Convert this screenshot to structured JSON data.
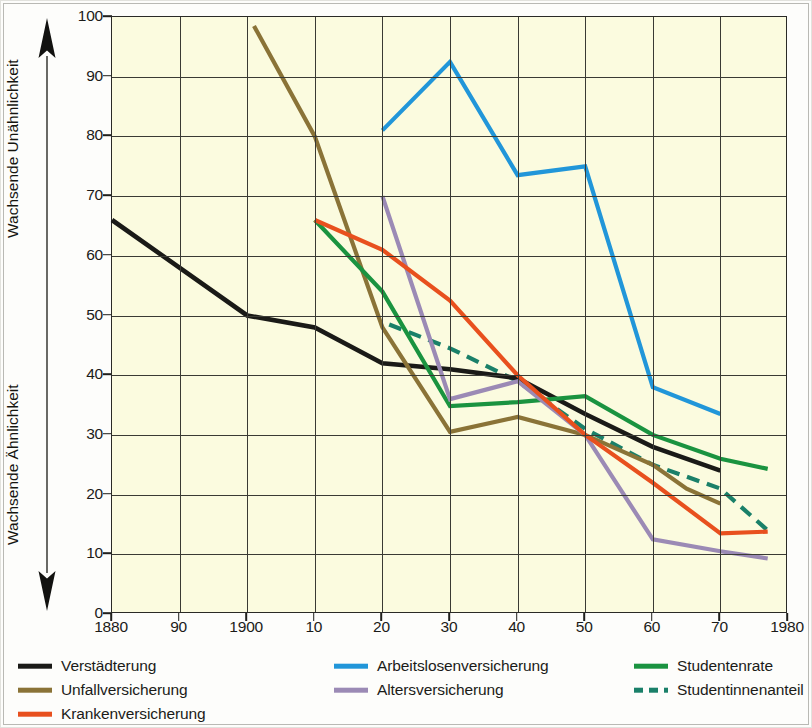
{
  "axes": {
    "y_caption_top": "Wachsende Unähnlichkeit",
    "y_caption_bottom": "Wachsende Ähnlichkeit",
    "y_ticks": [
      "0",
      "10",
      "20",
      "30",
      "40",
      "50",
      "60",
      "70",
      "80",
      "90",
      "100"
    ],
    "x_ticks": [
      "1880",
      "90",
      "1900",
      "10",
      "20",
      "30",
      "40",
      "50",
      "60",
      "70",
      "1980"
    ]
  },
  "legend": {
    "columns": [
      {
        "items": [
          {
            "label": "Verstädterung",
            "color": "#1a1a17",
            "style": "solid",
            "icon": "line-swatch-black"
          },
          {
            "label": "Unfallversicherung",
            "color": "#8a7337",
            "style": "solid",
            "icon": "line-swatch-tan"
          },
          {
            "label": "Krankenversicherung",
            "color": "#e8501e",
            "style": "solid",
            "icon": "line-swatch-orange"
          }
        ]
      },
      {
        "items": [
          {
            "label": "Arbeitslosenversicherung",
            "color": "#2196d9",
            "style": "solid",
            "icon": "line-swatch-blue"
          },
          {
            "label": "Altersversicherung",
            "color": "#9b8ab5",
            "style": "solid",
            "icon": "line-swatch-purple"
          }
        ]
      },
      {
        "items": [
          {
            "label": "Studentenrate",
            "color": "#1a9340",
            "style": "solid",
            "icon": "line-swatch-green"
          },
          {
            "label": "Studentinnenanteil",
            "color": "#1a8069",
            "style": "dashed",
            "icon": "line-swatch-green-dashed"
          }
        ]
      }
    ]
  },
  "chart_data": {
    "type": "line",
    "title": "",
    "xlabel": "",
    "ylabel": "Wachsende Unähnlichkeit / Wachsende Ähnlichkeit",
    "xlim": [
      1880,
      1980
    ],
    "ylim": [
      0,
      100
    ],
    "x_tick_values": [
      1880,
      1890,
      1900,
      1910,
      1920,
      1930,
      1940,
      1950,
      1960,
      1970,
      1980
    ],
    "y_tick_values": [
      0,
      10,
      20,
      30,
      40,
      50,
      60,
      70,
      80,
      90,
      100
    ],
    "grid": true,
    "legend_position": "below",
    "plot_background": "#fbfbdf",
    "series": [
      {
        "name": "Verstädterung",
        "color": "#1a1a17",
        "style": "solid",
        "points": [
          [
            1880,
            66
          ],
          [
            1900,
            50
          ],
          [
            1910,
            48
          ],
          [
            1920,
            42
          ],
          [
            1930,
            41
          ],
          [
            1940,
            39.5
          ],
          [
            1950,
            33.5
          ],
          [
            1960,
            28
          ],
          [
            1970,
            24
          ]
        ]
      },
      {
        "name": "Unfallversicherung",
        "color": "#8a7337",
        "style": "solid",
        "points": [
          [
            1901,
            98.5
          ],
          [
            1910,
            80
          ],
          [
            1920,
            48
          ],
          [
            1930,
            30.5
          ],
          [
            1940,
            33
          ],
          [
            1950,
            30
          ],
          [
            1960,
            25
          ],
          [
            1965,
            21
          ],
          [
            1970,
            18.5
          ]
        ]
      },
      {
        "name": "Krankenversicherung",
        "color": "#e8501e",
        "style": "solid",
        "points": [
          [
            1910,
            66
          ],
          [
            1920,
            61
          ],
          [
            1930,
            52.5
          ],
          [
            1940,
            40
          ],
          [
            1950,
            30
          ],
          [
            1960,
            22
          ],
          [
            1970,
            13.5
          ],
          [
            1977,
            13.8
          ]
        ]
      },
      {
        "name": "Arbeitslosenversicherung",
        "color": "#2196d9",
        "style": "solid",
        "points": [
          [
            1920,
            81
          ],
          [
            1930,
            92.5
          ],
          [
            1940,
            73.5
          ],
          [
            1950,
            75
          ],
          [
            1960,
            38
          ],
          [
            1970,
            33.5
          ]
        ]
      },
      {
        "name": "Altersversicherung",
        "color": "#9b8ab5",
        "style": "solid",
        "points": [
          [
            1920,
            70
          ],
          [
            1930,
            36
          ],
          [
            1940,
            39
          ],
          [
            1950,
            30
          ],
          [
            1960,
            12.5
          ],
          [
            1970,
            10.5
          ],
          [
            1977,
            9.3
          ]
        ]
      },
      {
        "name": "Studentenrate",
        "color": "#1a9340",
        "style": "solid",
        "points": [
          [
            1910,
            66
          ],
          [
            1920,
            54
          ],
          [
            1930,
            34.8
          ],
          [
            1940,
            35.5
          ],
          [
            1950,
            36.5
          ],
          [
            1960,
            30
          ],
          [
            1970,
            26
          ],
          [
            1977,
            24.3
          ]
        ]
      },
      {
        "name": "Studentinnenanteil",
        "color": "#1a8069",
        "style": "dashed",
        "points": [
          [
            1921,
            48.5
          ],
          [
            1930,
            44.5
          ],
          [
            1940,
            39
          ],
          [
            1950,
            31
          ],
          [
            1960,
            25
          ],
          [
            1970,
            21
          ],
          [
            1977,
            14
          ]
        ]
      }
    ]
  }
}
